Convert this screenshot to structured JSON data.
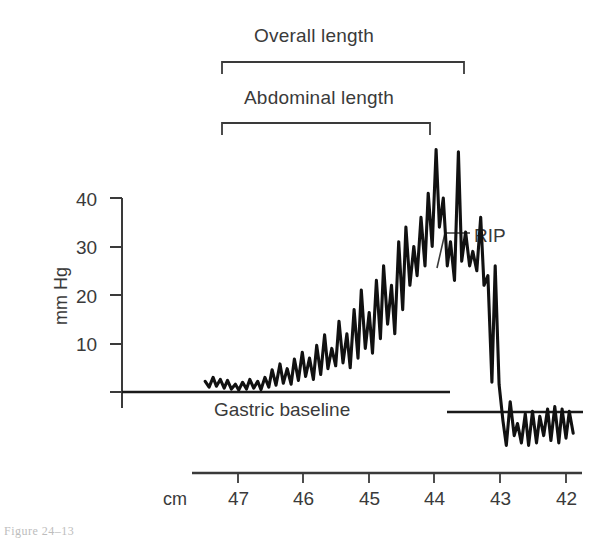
{
  "figure": {
    "caption_fragment": "Figure  24–13",
    "y_axis": {
      "label": "mm Hg",
      "ticks": [
        "40",
        "30",
        "20",
        "10"
      ],
      "tick_values": [
        40,
        30,
        20,
        10
      ],
      "range": [
        0,
        52
      ]
    },
    "x_axis": {
      "unit_label": "cm",
      "ticks": [
        "47",
        "46",
        "45",
        "44",
        "43",
        "42"
      ],
      "tick_values": [
        47,
        46,
        45,
        44,
        43,
        42
      ]
    },
    "brackets": [
      {
        "label": "Overall length",
        "from_cm": 47.3,
        "to_cm": 43.7
      },
      {
        "label": "Abdominal length",
        "from_cm": 47.3,
        "to_cm": 44.05
      }
    ],
    "annotations": [
      {
        "label": "RIP",
        "note": "respiratory inversion point"
      },
      {
        "label": "Gastric baseline"
      }
    ],
    "colors": {
      "trace": "#111111",
      "axis": "#2b2b2b",
      "text": "#3a3a3a",
      "background": "#ffffff"
    }
  },
  "chart_data": {
    "type": "line",
    "title": "",
    "xlabel": "cm",
    "ylabel": "mm Hg",
    "xlim": [
      47.7,
      41.8
    ],
    "ylim": [
      -14,
      52
    ],
    "grid": false,
    "legend": null,
    "baselines": [
      {
        "name": "Gastric baseline",
        "value": 0,
        "from_cm": 47.55,
        "to_cm": 43.9
      },
      {
        "name": "Esophageal baseline",
        "value": -6,
        "from_cm": 43.85,
        "to_cm": 41.85
      }
    ],
    "series": [
      {
        "name": "Intraluminal pressure",
        "x": [
          47.5,
          47.44,
          47.38,
          47.33,
          47.27,
          47.21,
          47.16,
          47.1,
          47.04,
          46.99,
          46.93,
          46.87,
          46.82,
          46.76,
          46.7,
          46.65,
          46.59,
          46.53,
          46.48,
          46.42,
          46.36,
          46.31,
          46.25,
          46.19,
          46.14,
          46.08,
          46.02,
          45.97,
          45.91,
          45.85,
          45.8,
          45.74,
          45.68,
          45.63,
          45.57,
          45.51,
          45.46,
          45.4,
          45.34,
          45.29,
          45.23,
          45.17,
          45.12,
          45.06,
          45.0,
          44.95,
          44.89,
          44.83,
          44.78,
          44.72,
          44.66,
          44.61,
          44.55,
          44.49,
          44.44,
          44.38,
          44.32,
          44.27,
          44.21,
          44.15,
          44.1,
          44.04,
          43.98,
          43.93,
          43.87,
          43.81,
          43.76,
          43.7,
          43.64,
          43.59,
          43.53,
          43.47,
          43.42,
          43.36,
          43.3,
          43.25,
          43.19,
          43.13,
          43.08,
          43.02,
          42.96,
          42.91,
          42.85,
          42.79,
          42.74,
          42.68,
          42.62,
          42.57,
          42.51,
          42.45,
          42.4,
          42.34,
          42.28,
          42.23,
          42.17,
          42.11,
          42.06,
          42.0,
          41.95,
          41.89
        ],
        "y": [
          2.2,
          1.0,
          3.0,
          1.2,
          2.6,
          0.8,
          2.4,
          0.6,
          1.6,
          0.4,
          2.0,
          0.6,
          2.6,
          0.8,
          2.2,
          0.5,
          3.0,
          1.0,
          4.6,
          1.4,
          5.8,
          1.8,
          4.8,
          1.6,
          6.8,
          2.4,
          8.2,
          3.2,
          7.0,
          2.6,
          9.6,
          3.6,
          11.8,
          4.8,
          9.0,
          5.4,
          14.6,
          6.0,
          12.0,
          5.0,
          17.0,
          7.0,
          21.0,
          9.0,
          16.4,
          8.0,
          23.0,
          11.0,
          26.0,
          14.0,
          22.0,
          12.0,
          31.0,
          17.0,
          34.0,
          22.0,
          30.0,
          24.0,
          36.0,
          26.0,
          41.0,
          30.0,
          50.0,
          34.0,
          40.0,
          26.0,
          31.0,
          23.0,
          49.5,
          27.0,
          33.0,
          26.0,
          29.0,
          25.0,
          36.0,
          22.0,
          24.0,
          2.0,
          26.0,
          1.5,
          -6.0,
          -11.0,
          -2.0,
          -9.0,
          -6.5,
          -10.5,
          -4.5,
          -11.0,
          -4.0,
          -10.5,
          -5.0,
          -9.0,
          -3.5,
          -10.0,
          -3.0,
          -10.5,
          -3.5,
          -9.5,
          -4.0,
          -8.5
        ]
      }
    ],
    "key_features": {
      "peak_pressure_mmHg": 50,
      "peak_location_cm": 43.98,
      "rip_location_cm": 43.87,
      "gastric_baseline_mmHg": 0,
      "esophageal_baseline_mmHg": -6
    }
  }
}
